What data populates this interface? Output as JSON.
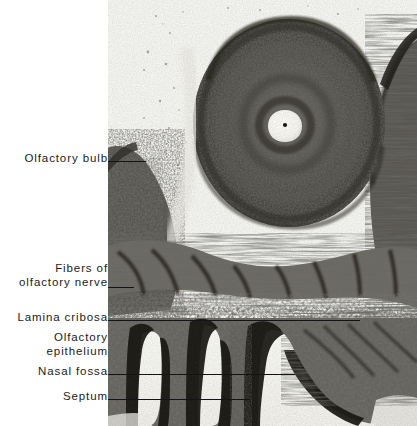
{
  "figure": {
    "kind": "histology-micrograph",
    "photo_region": {
      "x": 108,
      "y": 0,
      "width": 309,
      "height": 426
    },
    "background_color": "#ffffff",
    "ink_color": "#1b1b1b",
    "tissue_dark": "#2b2a28",
    "tissue_mid": "#8d8b86",
    "tissue_light": "#e9e8e3",
    "lumen_color": "#fbfbf7"
  },
  "labels": [
    {
      "id": "olfactory-bulb",
      "text": "Olfactory  bulb",
      "text_x": 14,
      "text_y": 152,
      "text_width": 94,
      "leader": {
        "x": 108,
        "y": 161,
        "width": 38
      }
    },
    {
      "id": "fibers-of-olfactory-nerve",
      "text": "Fibers of\nolfactory nerve",
      "text_x": 6,
      "text_y": 262,
      "text_width": 102,
      "leader": {
        "x": 108,
        "y": 287,
        "width": 26
      }
    },
    {
      "id": "lamina-cribosa",
      "text": "Lamina  cribosa",
      "text_x": 6,
      "text_y": 311,
      "text_width": 102,
      "leader": {
        "x": 108,
        "y": 320,
        "width": 252
      }
    },
    {
      "id": "olfactory-epithelium",
      "text": "Olfactory\nepithelium",
      "text_x": 14,
      "text_y": 331,
      "text_width": 94,
      "leader": {
        "x": 108,
        "y": 374,
        "width": 25
      }
    },
    {
      "id": "nasal-fossa",
      "text": "Nasal  fossa",
      "text_x": 18,
      "text_y": 365,
      "text_width": 90,
      "leader": {
        "x": 108,
        "y": 374,
        "width": 187
      }
    },
    {
      "id": "septum",
      "text": "Septum",
      "text_x": 40,
      "text_y": 390,
      "text_width": 68,
      "leader": {
        "x": 108,
        "y": 399,
        "width": 142
      }
    }
  ],
  "anatomy": {
    "olfactory_bulb": {
      "center_x": 181,
      "center_y": 123,
      "radius_x": 96,
      "radius_y": 104
    },
    "ventricle": {
      "center_x": 177,
      "center_y": 125,
      "radius_x": 14,
      "radius_y": 13
    },
    "ventricle_dot": {
      "center_x": 177,
      "center_y": 125,
      "radius": 2
    },
    "nasal_fossa_slits": 3,
    "septum_x": 172
  }
}
